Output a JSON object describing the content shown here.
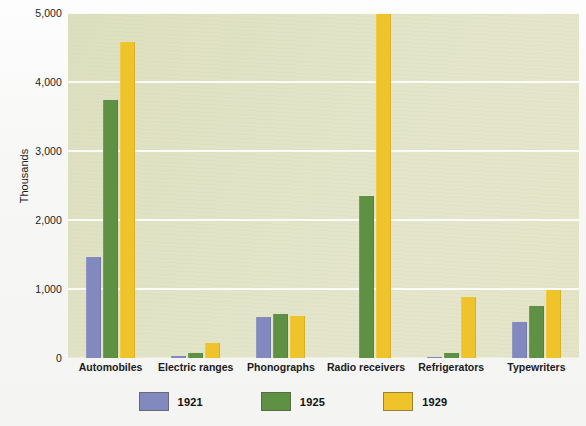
{
  "chart_data": {
    "type": "bar",
    "title": "",
    "xlabel": "",
    "ylabel": "Thousands",
    "ylim": [
      0,
      5000
    ],
    "yticks": [
      "0",
      "1,000",
      "2,000",
      "3,000",
      "4,000",
      "5,000"
    ],
    "ytick_values": [
      0,
      1000,
      2000,
      3000,
      4000,
      5000
    ],
    "grid": "horizontal",
    "legend_position": "bottom",
    "categories": [
      "Automobiles",
      "Electric ranges",
      "Phonographs",
      "Radio receivers",
      "Refrigerators",
      "Typewriters"
    ],
    "series": [
      {
        "name": "1921",
        "color": "#8189be",
        "values": [
          1468,
          30,
          596,
          0,
          5,
          523
        ]
      },
      {
        "name": "1925",
        "color": "#5f9145",
        "values": [
          3735,
          75,
          643,
          2350,
          75,
          755
        ]
      },
      {
        "name": "1929",
        "color": "#efc42b",
        "values": [
          4587,
          220,
          605,
          4990,
          890,
          980
        ]
      }
    ]
  },
  "legend": {
    "items": [
      {
        "label": "1921",
        "color": "#8189be"
      },
      {
        "label": "1925",
        "color": "#5f9145"
      },
      {
        "label": "1929",
        "color": "#efc42b"
      }
    ]
  },
  "axis": {
    "y_title": "Thousands"
  }
}
